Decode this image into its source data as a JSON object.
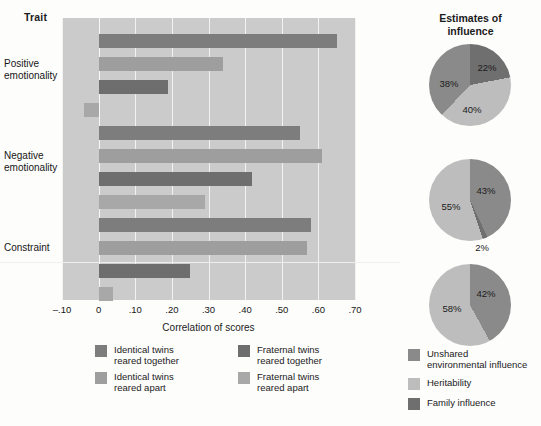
{
  "figure": {
    "clipped_top_text": "personality traits",
    "trait_header": "Trait",
    "xaxis_title": "Correlation of scores",
    "pies_title": "Estimates of\ninfluence"
  },
  "colors": {
    "identical_together": "#7d7d7d",
    "identical_apart": "#9e9e9e",
    "fraternal_together": "#6e6e6e",
    "fraternal_apart": "#a8a8a8",
    "plot_background": "#cbcbcb",
    "gridline": "#f2f2f0",
    "pie_unshared": "#8a8a8a",
    "pie_heritability": "#bdbdbd",
    "pie_family": "#6f6f6f"
  },
  "bar_legend": [
    {
      "label": "Identical twins\nreared together",
      "color_key": "identical_together",
      "col": 0,
      "row": 0
    },
    {
      "label": "Identical twins\nreared apart",
      "color_key": "identical_apart",
      "col": 0,
      "row": 1
    },
    {
      "label": "Fraternal twins\nreared together",
      "color_key": "fraternal_together",
      "col": 1,
      "row": 0
    },
    {
      "label": "Fraternal twins\nreared apart",
      "color_key": "fraternal_apart",
      "col": 1,
      "row": 1
    }
  ],
  "pie_legend": [
    {
      "label": "Unshared\nenvironmental influence",
      "color_key": "pie_unshared"
    },
    {
      "label": "Heritability",
      "color_key": "pie_heritability"
    },
    {
      "label": "Family influence",
      "color_key": "pie_family"
    }
  ],
  "chart_data": [
    {
      "type": "bar",
      "title": "Trait",
      "orientation": "horizontal",
      "xlabel": "Correlation of scores",
      "ylabel": "Trait",
      "xlim": [
        -0.1,
        0.7
      ],
      "xticks": [
        -0.1,
        0,
        0.1,
        0.2,
        0.3,
        0.4,
        0.5,
        0.6,
        0.7
      ],
      "xticklabels": [
        "-.10",
        "0",
        ".10",
        ".20",
        ".30",
        ".40",
        ".50",
        ".60",
        ".70"
      ],
      "grid": true,
      "legend_position": "bottom",
      "categories": [
        "Positive emotionality",
        "Negative emotionality",
        "Constraint"
      ],
      "series": [
        {
          "name": "Identical twins reared together",
          "values": [
            0.65,
            0.55,
            0.58
          ]
        },
        {
          "name": "Identical twins reared apart",
          "values": [
            0.34,
            0.61,
            0.57
          ]
        },
        {
          "name": "Fraternal twins reared together",
          "values": [
            0.19,
            0.42,
            0.25
          ]
        },
        {
          "name": "Fraternal twins reared apart",
          "values": [
            -0.04,
            0.29,
            0.04
          ]
        }
      ]
    },
    {
      "type": "pie",
      "title": "Estimates of influence",
      "subtitle": "Positive emotionality",
      "labels": [
        "Unshared environmental influence",
        "Heritability",
        "Family influence"
      ],
      "values": [
        38,
        40,
        22
      ],
      "display_labels": [
        "38%",
        "40%",
        "22%"
      ]
    },
    {
      "type": "pie",
      "title": "Estimates of influence",
      "subtitle": "Negative emotionality",
      "labels": [
        "Unshared environmental influence",
        "Heritability",
        "Family influence"
      ],
      "values": [
        43,
        55,
        2
      ],
      "display_labels": [
        "43%",
        "55%",
        "2%"
      ]
    },
    {
      "type": "pie",
      "title": "Estimates of influence",
      "subtitle": "Constraint",
      "labels": [
        "Unshared environmental influence",
        "Heritability",
        "Family influence"
      ],
      "values": [
        42,
        58,
        0
      ],
      "display_labels": [
        "42%",
        "58%",
        ""
      ]
    }
  ]
}
